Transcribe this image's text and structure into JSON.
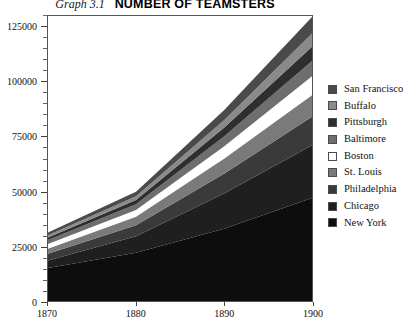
{
  "title": {
    "figure_number": "Graph 3.1",
    "main": "NUMBER OF TEAMSTERS"
  },
  "chart_data": {
    "type": "area",
    "stacked": true,
    "title": "NUMBER OF TEAMSTERS",
    "subtitle": "Graph 3.1",
    "xlabel": "",
    "ylabel": "",
    "x": [
      1870,
      1880,
      1890,
      1900
    ],
    "xlim": [
      1870,
      1900
    ],
    "ylim": [
      0,
      130000
    ],
    "xticks": [
      "1870",
      "1880",
      "1890",
      "1900"
    ],
    "yticks": [
      "0",
      "25000",
      "50000",
      "75000",
      "100000",
      "125000"
    ],
    "ytick_values": [
      0,
      25000,
      50000,
      75000,
      100000,
      125000
    ],
    "ytick_minor_step": 5000,
    "grid": false,
    "legend_position": "right",
    "series": [
      {
        "name": "New York",
        "color": "#0d0d0d",
        "values": [
          15000,
          22000,
          33000,
          47000
        ]
      },
      {
        "name": "Chicago",
        "color": "#1f1f1f",
        "values": [
          3500,
          7500,
          16000,
          24000
        ]
      },
      {
        "name": "Philadelphia",
        "color": "#3a3a3a",
        "values": [
          3000,
          5000,
          9000,
          13000
        ]
      },
      {
        "name": "St. Louis",
        "color": "#7a7a7a",
        "values": [
          2500,
          4000,
          7000,
          10000
        ]
      },
      {
        "name": "Boston",
        "color": "#ffffff",
        "values": [
          2000,
          3000,
          5500,
          8500
        ]
      },
      {
        "name": "Baltimore",
        "color": "#6e6e6e",
        "values": [
          1800,
          2600,
          4500,
          7000
        ]
      },
      {
        "name": "Pittsburgh",
        "color": "#2e2e2e",
        "values": [
          1200,
          2000,
          4000,
          6500
        ]
      },
      {
        "name": "Buffalo",
        "color": "#8a8a8a",
        "values": [
          1000,
          1700,
          3500,
          6000
        ]
      },
      {
        "name": "San Francisco",
        "color": "#4a4a4a",
        "values": [
          1200,
          2000,
          4500,
          7500
        ]
      }
    ]
  },
  "legend": {
    "items": [
      {
        "label": "San Francisco",
        "color": "#4a4a4a"
      },
      {
        "label": "Buffalo",
        "color": "#8a8a8a"
      },
      {
        "label": "Pittsburgh",
        "color": "#2e2e2e"
      },
      {
        "label": "Baltimore",
        "color": "#6e6e6e"
      },
      {
        "label": "Boston",
        "color": "#ffffff"
      },
      {
        "label": "St. Louis",
        "color": "#7a7a7a"
      },
      {
        "label": "Philadelphia",
        "color": "#3a3a3a"
      },
      {
        "label": "Chicago",
        "color": "#1f1f1f"
      },
      {
        "label": "New York",
        "color": "#0d0d0d"
      }
    ]
  }
}
